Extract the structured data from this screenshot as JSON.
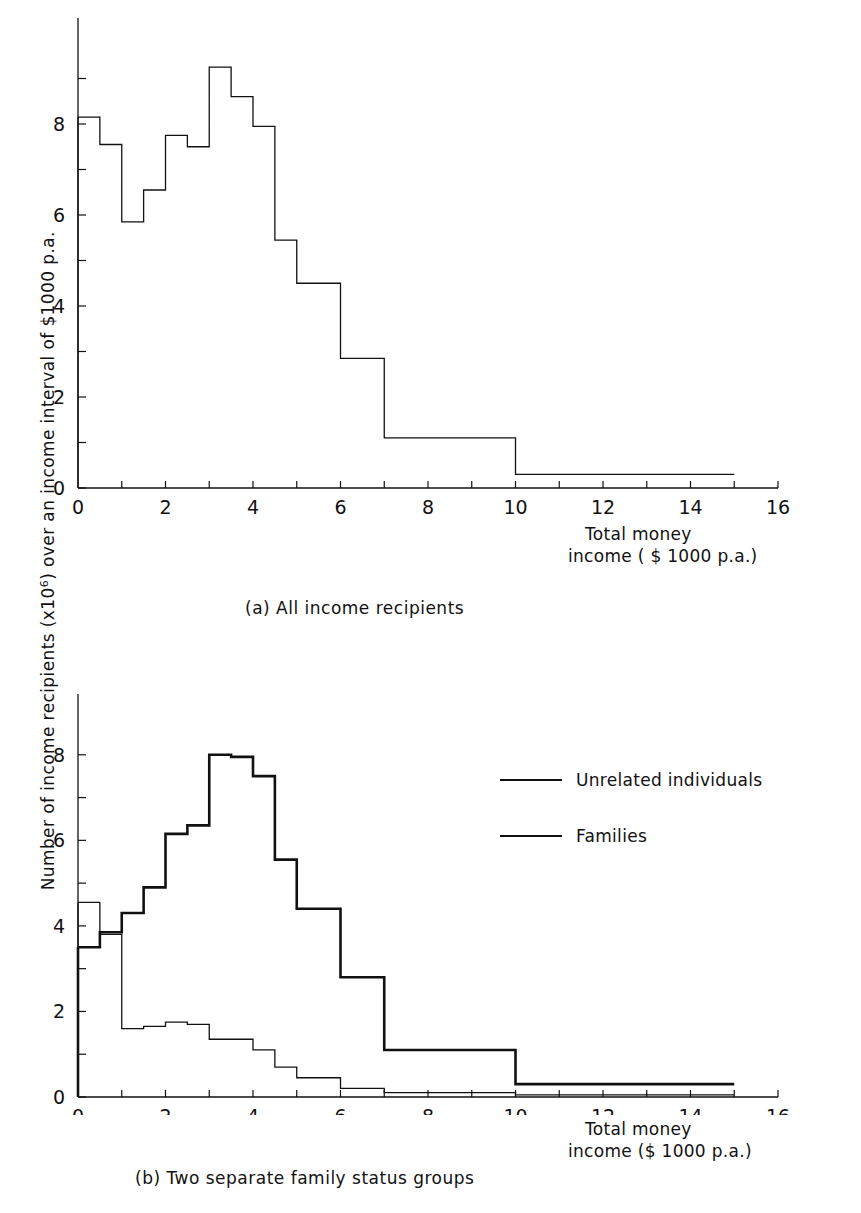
{
  "axis": {
    "y_label_pre": "Number of income recipients (x10",
    "y_label_sup": "6",
    "y_label_post": ") over an income interval of $1000 p.a.",
    "x_title_line1": "Total money",
    "x_title_line2_a": "income ( $ 1000 p.a.)",
    "x_title_line2_b": "income ($ 1000 p.a.)",
    "x_ticks": [
      "0",
      "2",
      "4",
      "6",
      "8",
      "10",
      "12",
      "14",
      "16"
    ],
    "y_ticks_a": [
      "0",
      "2",
      "4",
      "6",
      "8"
    ],
    "y_ticks_b": [
      "0",
      "2",
      "4",
      "6",
      "8"
    ]
  },
  "captions": {
    "a": "(a)  All income recipients",
    "b": "(b)  Two separate family status groups"
  },
  "legend": {
    "items": [
      {
        "label": "Unrelated individuals",
        "style": "thin"
      },
      {
        "label": "Families",
        "style": "thick"
      }
    ]
  },
  "colors": {
    "line": "#111111",
    "background": "#ffffff"
  },
  "chart_data": [
    {
      "type": "line",
      "subtype": "step-histogram",
      "title": "(a)  All income recipients",
      "xlabel": "Total money income ( $ 1000 p.a.)",
      "ylabel": "Number of income recipients (x10^6) over an income interval of $1000 p.a.",
      "xlim": [
        0,
        16
      ],
      "ylim": [
        0,
        10
      ],
      "xticks": [
        0,
        2,
        4,
        6,
        8,
        10,
        12,
        14,
        16
      ],
      "yticks": [
        0,
        2,
        4,
        6,
        8
      ],
      "minor_yticks": [
        1,
        3,
        5,
        7,
        9
      ],
      "grid": false,
      "legend": "none",
      "bin_edges": [
        0,
        0.5,
        1.0,
        1.5,
        2.0,
        2.5,
        3.0,
        3.5,
        4.0,
        4.5,
        5.0,
        6.0,
        7.0,
        10.0,
        15.0
      ],
      "series": [
        {
          "name": "All income recipients",
          "line_width": "thin",
          "values": [
            8.15,
            7.55,
            5.85,
            6.55,
            7.75,
            7.5,
            9.25,
            8.6,
            7.95,
            5.45,
            4.5,
            2.85,
            1.1,
            0.3
          ]
        }
      ]
    },
    {
      "type": "line",
      "subtype": "step-histogram",
      "title": "(b)  Two separate family status groups",
      "xlabel": "Total money income ($ 1000 p.a.)",
      "ylabel": "Number of income recipients (x10^6) over an income interval of $1000 p.a.",
      "xlim": [
        0,
        16
      ],
      "ylim": [
        0,
        9
      ],
      "xticks": [
        0,
        2,
        4,
        6,
        8,
        10,
        12,
        14,
        16
      ],
      "yticks": [
        0,
        2,
        4,
        6,
        8
      ],
      "minor_yticks": [
        1,
        3,
        5,
        7
      ],
      "grid": false,
      "legend": "upper right",
      "bin_edges": [
        0,
        0.5,
        1.0,
        1.5,
        2.0,
        2.5,
        3.0,
        3.5,
        4.0,
        4.5,
        5.0,
        6.0,
        7.0,
        10.0,
        15.0
      ],
      "series": [
        {
          "name": "Families",
          "line_width": "thick",
          "values": [
            3.5,
            3.85,
            4.3,
            4.9,
            6.15,
            6.35,
            8.0,
            7.95,
            7.5,
            5.55,
            4.4,
            2.8,
            1.1,
            0.3
          ]
        },
        {
          "name": "Unrelated individuals",
          "line_width": "thin",
          "values": [
            4.55,
            3.8,
            1.6,
            1.65,
            1.75,
            1.7,
            1.35,
            1.35,
            1.1,
            0.7,
            0.45,
            0.2,
            0.1,
            0.05
          ]
        }
      ]
    }
  ]
}
